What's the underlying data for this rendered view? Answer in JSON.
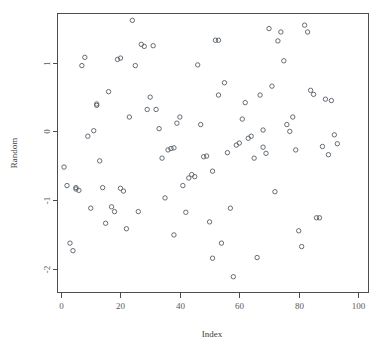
{
  "chart_data": {
    "type": "scatter",
    "title": "",
    "subtitle": "",
    "xlabel": "Index",
    "ylabel": "Random",
    "grid": false,
    "legend": null,
    "legend_position": "none",
    "marker": "open-circle",
    "marker_color": "#555e66",
    "frame_color": "#4d4d4d",
    "background": "#ffffff",
    "xlim": [
      -1.2,
      103.5
    ],
    "ylim": [
      -2.35,
      1.72
    ],
    "xticks": [
      0,
      20,
      40,
      60,
      80,
      100
    ],
    "xtick_labels": [
      "0",
      "20",
      "40",
      "60",
      "80",
      "100"
    ],
    "yticks": [
      1,
      0,
      -1,
      -2
    ],
    "ytick_labels": [
      "1",
      "0",
      "-1",
      "-2"
    ],
    "n_points": 100,
    "x": [
      1,
      2,
      3,
      4,
      5,
      5,
      6,
      7,
      8,
      9,
      10,
      11,
      12,
      12,
      13,
      14,
      15,
      16,
      17,
      18,
      19,
      20,
      20,
      21,
      22,
      23,
      24,
      25,
      26,
      27,
      28,
      29,
      30,
      31,
      32,
      33,
      34,
      35,
      36,
      37,
      38,
      38,
      39,
      40,
      41,
      42,
      43,
      44,
      45,
      46,
      47,
      48,
      49,
      50,
      51,
      51,
      52,
      53,
      53,
      54,
      55,
      56,
      57,
      58,
      59,
      60,
      61,
      62,
      63,
      64,
      65,
      66,
      67,
      68,
      68,
      69,
      70,
      71,
      72,
      73,
      74,
      75,
      76,
      77,
      78,
      79,
      80,
      81,
      82,
      83,
      84,
      85,
      86,
      87,
      88,
      89,
      90,
      91,
      92,
      93,
      94,
      95,
      96,
      97,
      98,
      99,
      100
    ],
    "y": [
      -0.52,
      -0.79,
      -1.63,
      -1.74,
      -0.82,
      -0.84,
      -0.86,
      0.96,
      1.08,
      -0.07,
      -1.12,
      0.01,
      0.38,
      0.4,
      -0.43,
      -0.82,
      -1.34,
      0.58,
      -1.1,
      -1.17,
      1.05,
      1.07,
      -0.83,
      -0.87,
      -1.42,
      0.21,
      1.62,
      0.96,
      -1.17,
      1.27,
      1.24,
      0.32,
      0.5,
      1.25,
      0.32,
      0.04,
      -0.39,
      -0.97,
      -0.27,
      -0.25,
      -0.24,
      -1.51,
      0.12,
      0.21,
      -0.79,
      -1.18,
      -0.68,
      -0.63,
      -0.66,
      0.97,
      0.1,
      -0.37,
      -0.36,
      -1.32,
      -1.85,
      -0.58,
      1.33,
      0.53,
      1.33,
      -1.63,
      0.71,
      -0.31,
      -1.12,
      -2.12,
      -0.2,
      -0.17,
      0.18,
      0.42,
      -0.1,
      -0.07,
      -0.39,
      -1.84,
      0.53,
      0.02,
      -0.23,
      -0.32,
      1.5,
      0.66,
      -0.88,
      1.32,
      1.45,
      1.03,
      0.1,
      0.0,
      0.21,
      -0.27,
      -1.45,
      -1.68,
      1.55,
      1.45,
      0.6,
      0.54,
      -1.26,
      -1.26,
      -0.22,
      0.47,
      -0.34,
      0.45,
      -0.05,
      -0.18
    ],
    "points_note": "100 standard-normal random values plotted against index 1..100"
  },
  "axes": {
    "x_title": "Index",
    "y_title": "Random"
  },
  "ticks": {
    "x": [
      "0",
      "20",
      "40",
      "60",
      "80",
      "100"
    ],
    "y": [
      "1",
      "0",
      "-1",
      "-2"
    ]
  }
}
